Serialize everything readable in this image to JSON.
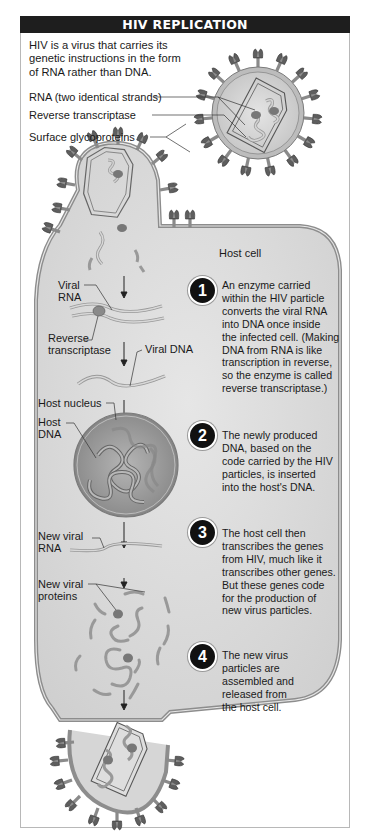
{
  "title": "HIV REPLICATION",
  "intro": {
    "lines": [
      "HIV is a virus that carries its",
      "genetic instructions in the form",
      "of RNA rather than DNA."
    ]
  },
  "virus_labels": {
    "rna": "RNA (two identical strands)",
    "reverse_transcriptase": "Reverse transcriptase",
    "glycoproteins": "Surface glycoproteins"
  },
  "cell_label": "Host cell",
  "diagram_labels": {
    "viral_rna": [
      "Viral",
      "RNA"
    ],
    "reverse_transcriptase": [
      "Reverse",
      "transcriptase"
    ],
    "viral_dna": "Viral DNA",
    "host_nucleus": "Host nucleus",
    "host_dna": [
      "Host",
      "DNA"
    ],
    "new_viral_rna": [
      "New viral",
      "RNA"
    ],
    "new_viral_proteins": [
      "New viral",
      "proteins"
    ]
  },
  "steps": [
    {
      "number": "1",
      "lines": [
        "An enzyme carried",
        "within the HIV particle",
        "converts the viral RNA",
        "into DNA once inside",
        "the infected cell. (Making",
        "DNA from RNA is like",
        "transcription in reverse,",
        "so the enzyme is called",
        "reverse transcriptase.)"
      ]
    },
    {
      "number": "2",
      "lines": [
        "The newly produced",
        "DNA, based on the",
        "code carried by the HIV",
        "particles, is inserted",
        "into the host's DNA."
      ]
    },
    {
      "number": "3",
      "lines": [
        "The host cell then",
        "transcribes the genes",
        "from HIV, much like it",
        "transcribes other genes.",
        "But these genes code",
        "for the production of",
        "new virus particles."
      ]
    },
    {
      "number": "4",
      "lines": [
        "The new virus",
        "particles are",
        "assembled and",
        "released from",
        "the host cell."
      ]
    }
  ],
  "colors": {
    "banner": "#1e1e1e",
    "cell_fill": "#dcdcdc",
    "membrane": "#a8a8a8",
    "nucleus": "#9a9a9a",
    "badge": "#111111"
  }
}
